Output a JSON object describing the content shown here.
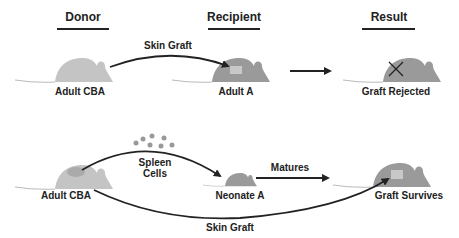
{
  "headers": {
    "donor": "Donor",
    "recipient": "Recipient",
    "result": "Result"
  },
  "row1": {
    "donor_label": "Adult CBA",
    "arrow_label": "Skin Graft",
    "recipient_label": "Adult A",
    "result_label": "Graft Rejected"
  },
  "row2": {
    "donor_label": "Adult CBA",
    "arrow_label": "Spleen\nCells",
    "spleen_line1": "Spleen",
    "spleen_line2": "Cells",
    "recipient_label": "Neonate A",
    "mid_arrow_label": "Matures",
    "result_label": "Graft Survives",
    "bottom_arrow_label": "Skin Graft"
  },
  "colors": {
    "donor_mouse": "#c4c4c4",
    "recipient_mouse": "#9a9a9a",
    "graft_patch": "#c8c8c8",
    "ink": "#222222"
  }
}
